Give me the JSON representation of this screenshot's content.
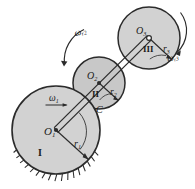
{
  "figure": {
    "type": "mechanism-diagram",
    "background_color": "#ffffff",
    "gear_fill": "#d2d2d2",
    "gear_fill_dark": "#c2c2c2",
    "stroke_color": "#2b2b2b"
  },
  "gears": [
    {
      "id": "gear-1",
      "roman_label": "I",
      "center_label": "O",
      "center_sub": "1",
      "radius_label": "r",
      "radius_sub": "1",
      "cx": 56,
      "cy": 130,
      "r": 44,
      "grounded": true
    },
    {
      "id": "gear-2",
      "roman_label": "II",
      "center_label": "O",
      "center_sub": "2",
      "radius_label": "r",
      "radius_sub": "2",
      "cx": 99,
      "cy": 83,
      "r": 26,
      "grounded": false
    },
    {
      "id": "gear-3",
      "roman_label": "III",
      "center_label": "O",
      "center_sub": "3",
      "radius_label": "r",
      "radius_sub": "3",
      "cx": 149,
      "cy": 38,
      "r": 31,
      "grounded": false
    }
  ],
  "annotations": {
    "omega1": {
      "symbol": "ω",
      "sub": "1",
      "x": 49,
      "y": 100
    },
    "omega_r2": {
      "symbol": "ω",
      "sub": "r2",
      "x": 73,
      "y": 36
    },
    "omega_r3": {
      "symbol": "ω",
      "sub": "r3",
      "x": 164,
      "y": 58
    },
    "contact_point": {
      "label": "C",
      "x": 97,
      "y": 108
    }
  },
  "link": {
    "name": "carrier-link",
    "from": "O1",
    "to": "O3"
  },
  "ground": {
    "name": "fixed-ground-hatching",
    "tick_count": 17
  }
}
